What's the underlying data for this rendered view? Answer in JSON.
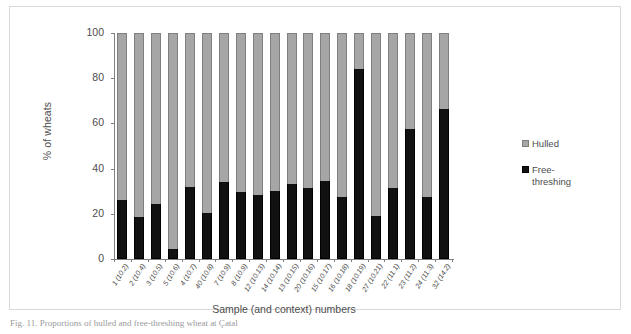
{
  "figure": {
    "caption": "Fig. 11. Proportions of hulled and free-threshing wheat at Çatal"
  },
  "legend": {
    "position": "right",
    "items": [
      {
        "label": "Hulled",
        "color": "#a6a6a6",
        "key": "hulled"
      },
      {
        "label": "Free-\nthreshing",
        "color": "#111111",
        "key": "free_threshing"
      }
    ]
  },
  "axes": {
    "y_title": "% of wheats",
    "x_title": "Sample (and context) numbers",
    "y_ticks": [
      "0",
      "20",
      "40",
      "60",
      "80",
      "100"
    ]
  },
  "chart_data": {
    "type": "bar",
    "stacked": true,
    "stack_total": 100,
    "title": "",
    "xlabel": "Sample (and context) numbers",
    "ylabel": "% of wheats",
    "ylim": [
      0,
      100
    ],
    "yticks": [
      0,
      20,
      40,
      60,
      80,
      100
    ],
    "grid": false,
    "legend_position": "right",
    "categories": [
      "1 (10.2)",
      "2 (10.4)",
      "3 (10.5)",
      "5 (10.6)",
      "4 (10.7)",
      "40 (10.8)",
      "7 (10.9)",
      "8 (10.9)",
      "12 (10.13)",
      "14 (10.14)",
      "13 (10.15)",
      "20 (10.16)",
      "15 (10.17)",
      "16 (10.18)",
      "18 (10.19)",
      "27 (10.21)",
      "22 (11.1)",
      "23 (11.2)",
      "24 (11.3)",
      "32 (14.2)"
    ],
    "series": [
      {
        "name": "Free-threshing",
        "color": "#111111",
        "values": [
          26,
          18.5,
          24.5,
          4.5,
          32,
          20.5,
          34,
          29.5,
          28.5,
          30,
          33,
          31.5,
          34.5,
          27.5,
          84,
          19,
          31.5,
          57.5,
          27.5,
          66.5
        ]
      },
      {
        "name": "Hulled",
        "color": "#a6a6a6",
        "values": [
          74,
          81.5,
          75.5,
          95.5,
          68,
          79.5,
          66,
          70.5,
          71.5,
          70,
          67,
          68.5,
          65.5,
          72.5,
          16,
          81,
          68.5,
          42.5,
          72.5,
          33.5
        ]
      }
    ]
  }
}
